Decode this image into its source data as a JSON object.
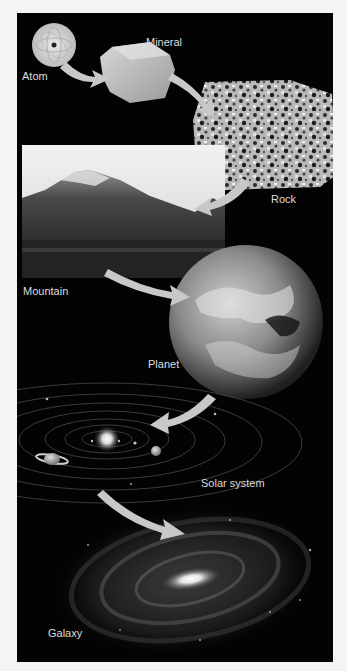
{
  "diagram": {
    "type": "scale-hierarchy",
    "stages": [
      {
        "id": "atom",
        "label": "Atom"
      },
      {
        "id": "mineral",
        "label": "Mineral"
      },
      {
        "id": "rock",
        "label": "Rock"
      },
      {
        "id": "mountain",
        "label": "Mountain"
      },
      {
        "id": "planet",
        "label": "Planet"
      },
      {
        "id": "solar-system",
        "label": "Solar system"
      },
      {
        "id": "galaxy",
        "label": "Galaxy"
      }
    ],
    "arrows": [
      {
        "from": "atom",
        "to": "mineral"
      },
      {
        "from": "mineral",
        "to": "rock"
      },
      {
        "from": "rock",
        "to": "mountain"
      },
      {
        "from": "mountain",
        "to": "planet"
      },
      {
        "from": "planet",
        "to": "solar-system"
      },
      {
        "from": "solar-system",
        "to": "galaxy"
      }
    ],
    "colors": {
      "background": "#030303",
      "page": "#f4f4f4",
      "arrow": "#c8c8c8",
      "label": "#dcdcdc"
    }
  }
}
